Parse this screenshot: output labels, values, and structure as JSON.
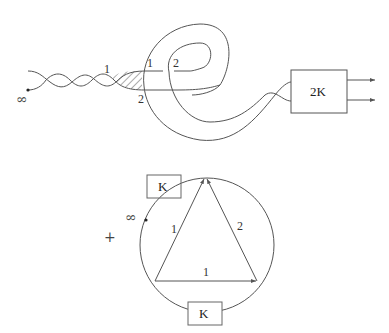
{
  "top_diagram": {
    "strand_labels": {
      "hatch_top": "1",
      "hatch_bottom": "2",
      "loop_left": "1",
      "loop_right": "2"
    },
    "box_label": "2K",
    "infinity_symbol": "∞",
    "output_arrows": 2
  },
  "bottom_diagram": {
    "plus_sign": "+",
    "infinity_symbol": "∞",
    "box_top_label": "K",
    "box_bottom_label": "K",
    "chord_labels": {
      "left_edge": "1",
      "right_edge": "2",
      "bottom_edge": "1"
    }
  },
  "colors": {
    "line": "#555555",
    "text": "#333333",
    "background": "#ffffff"
  }
}
